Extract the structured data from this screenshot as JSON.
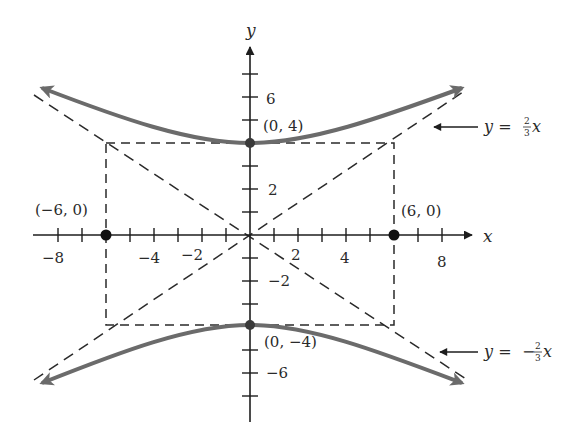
{
  "figure": {
    "type": "hyperbola-graph",
    "equation": "y^2/16 - x^2/36 = 1",
    "colors": {
      "curve": "#6b6b6b",
      "axis": "#1e1e1e",
      "dashed": "#2a2a2a",
      "text": "#2a2a2a",
      "background": "#ffffff"
    },
    "axes": {
      "x_label": "x",
      "y_label": "y",
      "x_ticks": [
        -8,
        -7,
        -6,
        -5,
        -4,
        -3,
        -2,
        -1,
        1,
        2,
        3,
        4,
        5,
        6,
        7,
        8
      ],
      "y_ticks": [
        -7,
        -6,
        -5,
        -3,
        -2,
        -1,
        1,
        2,
        3,
        5,
        6,
        7
      ],
      "x_tick_labels": [
        "−8",
        "−4",
        "−2",
        "2",
        "4",
        "8"
      ],
      "y_tick_labels": [
        "6",
        "2",
        "−2",
        "−6"
      ]
    },
    "points": [
      {
        "label": "(0, 4)",
        "x": 0,
        "y": 4
      },
      {
        "label": "(0, −4)",
        "x": 0,
        "y": -4
      },
      {
        "label": "(−6, 0)",
        "x": -6,
        "y": 0
      },
      {
        "label": "(6, 0)",
        "x": 6,
        "y": 0
      }
    ],
    "asymptotes": [
      {
        "label_prefix": "y = ",
        "sign": "",
        "num": "2",
        "den": "3",
        "var": "x"
      },
      {
        "label_prefix": "y = ",
        "sign": "−",
        "num": "2",
        "den": "3",
        "var": "x"
      }
    ],
    "rectangle": {
      "x_min": -6,
      "x_max": 6,
      "y_min": -4,
      "y_max": 4
    }
  }
}
